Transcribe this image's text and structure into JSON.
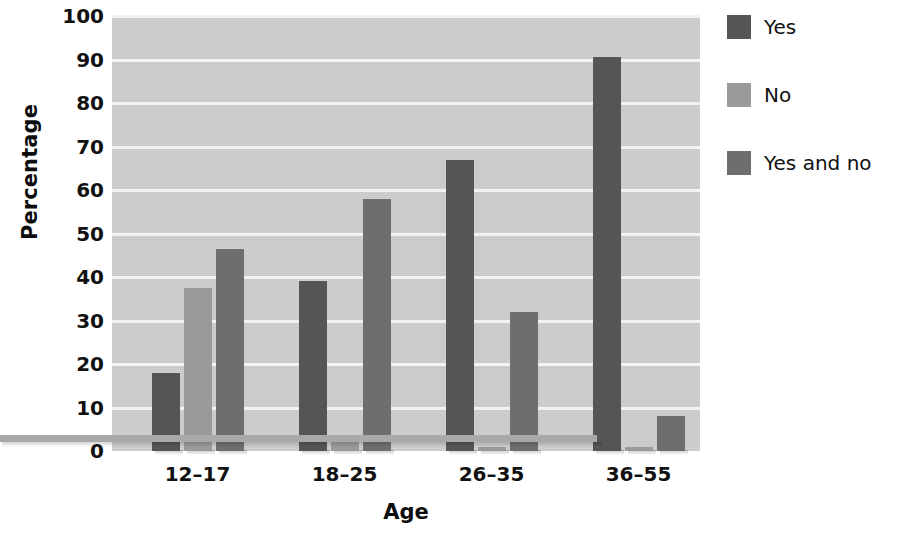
{
  "chart_data": {
    "type": "bar",
    "title": "",
    "xlabel": "Age",
    "ylabel": "Percentage",
    "categories": [
      "12–17",
      "18–25",
      "26–35",
      "36–55"
    ],
    "series": [
      {
        "name": "Yes",
        "color": "#555555",
        "values": [
          18,
          39,
          67,
          90.5
        ]
      },
      {
        "name": "No",
        "color": "#9a9a9a",
        "values": [
          37.5,
          2,
          1,
          1
        ]
      },
      {
        "name": "Yes and no",
        "color": "#6e6e6e",
        "values": [
          46.5,
          58,
          32,
          8
        ]
      }
    ],
    "ylim": [
      0,
      100
    ],
    "yticks": [
      0,
      10,
      20,
      30,
      40,
      50,
      60,
      70,
      80,
      90,
      100
    ],
    "ytick_labels": [
      "0",
      "10",
      "20",
      "30",
      "40",
      "50",
      "60",
      "70",
      "80",
      "90",
      "100"
    ],
    "grid": true,
    "grid_axis": "y",
    "grid_color": "#f2f2f2",
    "plot_background": "#cdcdcd",
    "page_background": "#ffffff",
    "legend_position": "right-top",
    "legend_entries": [
      "Yes",
      "No",
      "Yes and no"
    ]
  }
}
